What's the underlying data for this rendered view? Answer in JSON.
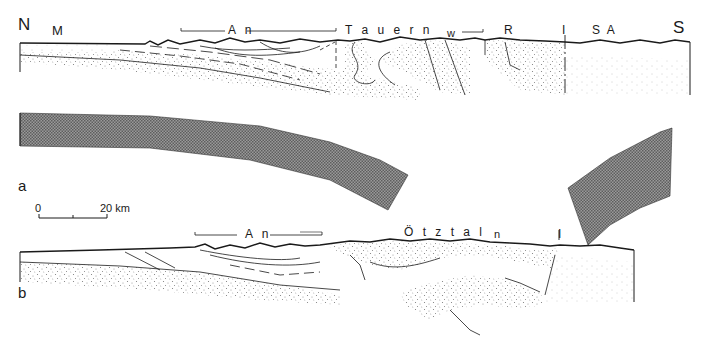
{
  "figure": {
    "type": "geological cross-section",
    "panels": [
      {
        "id": "a",
        "label": "a",
        "orientation": {
          "left": "N",
          "right": "S"
        },
        "annotations": [
          "M",
          "An",
          "Tauern",
          "w",
          "R",
          "I",
          "SA"
        ]
      },
      {
        "id": "b",
        "label": "b",
        "annotations": [
          "An",
          "Ötztal",
          "n",
          "I"
        ]
      }
    ],
    "scale_bar": {
      "start": "0",
      "end": "20 km"
    }
  },
  "labels": {
    "north": "N",
    "south": "S",
    "m": "M",
    "an_a": "A n",
    "tauern": "T a u e r n",
    "w": "w",
    "r": "R",
    "i_a": "I",
    "sa": "S A",
    "panel_a": "a",
    "panel_b": "b",
    "scale_zero": "0",
    "scale_end": "20 km",
    "an_b": "A n",
    "otztal": "Ö t z t a l",
    "n": "n",
    "i_b": "I"
  },
  "colors": {
    "ink": "#1a1a1a",
    "slab": "#7a7a7a",
    "stipple": "#8a8a8a",
    "background": "#ffffff"
  }
}
